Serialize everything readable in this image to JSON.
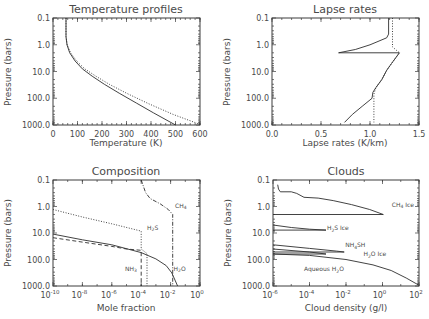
{
  "chart_data": [
    {
      "id": "temperature",
      "type": "line",
      "title": "Temperature profiles",
      "xlabel": "Temperature (K)",
      "ylabel": "Pressure (bars)",
      "xscale": "linear",
      "yscale": "log",
      "xlim": [
        0,
        600
      ],
      "ylim": [
        0.1,
        1000
      ],
      "y_inverted": true,
      "xticks": [
        0,
        100,
        200,
        300,
        400,
        500,
        600
      ],
      "xtick_labels": [
        "0",
        "100",
        "200",
        "300",
        "400",
        "500",
        "600"
      ],
      "yticks": [
        0.1,
        1,
        10,
        100,
        1000
      ],
      "ytick_labels": [
        "0.1",
        "1.0",
        "10.0",
        "100.0",
        "1000.0"
      ],
      "series": [
        {
          "name": "solid",
          "style": "solid",
          "points": [
            [
              53,
              0.1
            ],
            [
              53,
              0.5
            ],
            [
              57,
              1.0
            ],
            [
              68,
              2
            ],
            [
              90,
              4
            ],
            [
              120,
              8
            ],
            [
              160,
              15
            ],
            [
              210,
              30
            ],
            [
              270,
              65
            ],
            [
              340,
              150
            ],
            [
              410,
              350
            ],
            [
              500,
              1000
            ]
          ]
        },
        {
          "name": "dotted",
          "style": "dotted",
          "points": [
            [
              53,
              0.1
            ],
            [
              53,
              0.5
            ],
            [
              58,
              1.0
            ],
            [
              72,
              2
            ],
            [
              96,
              4
            ],
            [
              130,
              8
            ],
            [
              175,
              15
            ],
            [
              230,
              30
            ],
            [
              300,
              65
            ],
            [
              390,
              160
            ],
            [
              490,
              400
            ],
            [
              600,
              950
            ]
          ]
        }
      ]
    },
    {
      "id": "lapse",
      "type": "line",
      "title": "Lapse rates",
      "xlabel": "Lapse rates (K/km)",
      "ylabel": "Pressure (bars)",
      "xscale": "linear",
      "yscale": "log",
      "xlim": [
        0,
        1.5
      ],
      "ylim": [
        0.1,
        1000
      ],
      "y_inverted": true,
      "xticks": [
        0,
        0.5,
        1.0,
        1.5
      ],
      "xtick_labels": [
        "0.0",
        "0.5",
        "1.0",
        "1.5"
      ],
      "yticks": [
        0.1,
        1,
        10,
        100,
        1000
      ],
      "ytick_labels": [
        "0.1",
        "1.0",
        "10.0",
        "100.0",
        "1000.0"
      ],
      "series": [
        {
          "name": "solid",
          "style": "solid",
          "points": [
            [
              1.19,
              0.1
            ],
            [
              1.19,
              0.4
            ],
            [
              1.17,
              0.55
            ],
            [
              1.0,
              1.0
            ],
            [
              0.85,
              1.5
            ],
            [
              0.68,
              2.0
            ],
            [
              1.3,
              2.0
            ],
            [
              1.22,
              5
            ],
            [
              1.17,
              9
            ],
            [
              1.12,
              20
            ],
            [
              1.06,
              40
            ],
            [
              1.03,
              60
            ],
            [
              1.02,
              100
            ],
            [
              0.92,
              200
            ],
            [
              0.82,
              400
            ],
            [
              0.74,
              800
            ]
          ]
        },
        {
          "name": "dotted",
          "style": "dotted",
          "points": [
            [
              1.23,
              0.1
            ],
            [
              1.23,
              1.2
            ],
            [
              1.3,
              2.0
            ],
            [
              1.22,
              5
            ],
            [
              1.17,
              9
            ],
            [
              1.12,
              20
            ],
            [
              1.06,
              40
            ],
            [
              1.04,
              70
            ],
            [
              1.04,
              800
            ]
          ]
        }
      ]
    },
    {
      "id": "composition",
      "type": "line",
      "title": "Composition",
      "xlabel": "Mole fraction",
      "ylabel": "Pressure (bars)",
      "xscale": "log",
      "yscale": "log",
      "xlim": [
        1e-10,
        1
      ],
      "ylim": [
        0.1,
        1000
      ],
      "y_inverted": true,
      "xticks": [
        1e-10,
        1e-08,
        1e-06,
        0.0001,
        0.01,
        1
      ],
      "xtick_labels": [
        "10",
        "10",
        "10",
        "10",
        "10",
        "10"
      ],
      "xtick_exponents": [
        "-10",
        "-8",
        "-6",
        "-4",
        "-2",
        "0"
      ],
      "yticks": [
        0.1,
        1,
        10,
        100,
        1000
      ],
      "ytick_labels": [
        "0.1",
        "1.0",
        "10.0",
        "100.0",
        "1000.0"
      ],
      "series": [
        {
          "name": "CH4",
          "style": "dashdot",
          "points": [
            [
              0.0001,
              0.1
            ],
            [
              0.0002,
              0.3
            ],
            [
              0.0004,
              0.5
            ],
            [
              0.002,
              0.8
            ],
            [
              0.007,
              1.3
            ],
            [
              0.014,
              2.0
            ],
            [
              0.014,
              1000
            ]
          ]
        },
        {
          "name": "H2S",
          "style": "dotted",
          "points": [
            [
              1e-10,
              1.3
            ],
            [
              1e-08,
              2.5
            ],
            [
              1e-06,
              4.5
            ],
            [
              0.0001,
              8.5
            ],
            [
              0.0001,
              40
            ],
            [
              0.00025,
              60
            ],
            [
              0.00025,
              1000
            ]
          ]
        },
        {
          "name": "NH3",
          "style": "dashed",
          "points": [
            [
              1e-10,
              15
            ],
            [
              1e-08,
              22
            ],
            [
              1e-06,
              32
            ],
            [
              1e-05,
              40
            ],
            [
              0.0001,
              45
            ],
            [
              0.0001,
              1000
            ]
          ]
        },
        {
          "name": "H2O",
          "style": "solid",
          "points": [
            [
              1e-10,
              11
            ],
            [
              1e-08,
              18
            ],
            [
              1e-06,
              28
            ],
            [
              0.0001,
              55
            ],
            [
              0.001,
              95
            ],
            [
              0.005,
              170
            ],
            [
              0.012,
              320
            ],
            [
              0.02,
              600
            ],
            [
              0.03,
              1000
            ]
          ]
        }
      ],
      "annotations": [
        {
          "text": "CH",
          "sub": "4",
          "x": 0.02,
          "y": 1.1
        },
        {
          "text": "H",
          "sub": "2",
          "post": "S",
          "x": 0.00025,
          "y": 7.5
        },
        {
          "text": "NH",
          "sub": "3",
          "x": 8e-06,
          "y": 270
        },
        {
          "text": "H",
          "sub": "2",
          "post": "O",
          "x": 0.016,
          "y": 270
        }
      ]
    },
    {
      "id": "clouds",
      "type": "line",
      "title": "Clouds",
      "xlabel": "Cloud density (g/l)",
      "ylabel": "Pressure (bars)",
      "xscale": "log",
      "yscale": "log",
      "xlim": [
        1e-06,
        100
      ],
      "ylim": [
        0.1,
        1000
      ],
      "y_inverted": true,
      "xticks": [
        1e-06,
        0.0001,
        0.01,
        1,
        100
      ],
      "xtick_labels": [
        "10",
        "10",
        "10",
        "10",
        "10"
      ],
      "xtick_exponents": [
        "-6",
        "-4",
        "-2",
        "0",
        "2"
      ],
      "yticks": [
        0.1,
        1,
        10,
        100,
        1000
      ],
      "ytick_labels": [
        "0.1",
        "1.0",
        "10.0",
        "100.0",
        "1000.0"
      ],
      "series": [
        {
          "name": "CH4 Ice",
          "style": "solid",
          "points": [
            [
              1.8e-06,
              0.15
            ],
            [
              2e-06,
              0.22
            ],
            [
              2.5e-06,
              0.28
            ],
            [
              1e-05,
              0.28
            ],
            [
              2e-05,
              0.32
            ],
            [
              5e-05,
              0.45
            ],
            [
              0.0003,
              0.48
            ],
            [
              0.002,
              0.6
            ],
            [
              0.02,
              0.85
            ],
            [
              0.2,
              1.3
            ],
            [
              1.1,
              2.0
            ],
            [
              1e-06,
              2.0
            ]
          ]
        },
        {
          "name": "H2S Ice",
          "style": "solid",
          "points": [
            [
              1e-06,
              5
            ],
            [
              1e-05,
              6.2
            ],
            [
              0.0001,
              7.2
            ],
            [
              0.0008,
              7.8
            ],
            [
              1e-06,
              7.8
            ]
          ]
        },
        {
          "name": "NH4SH",
          "style": "solid",
          "points": [
            [
              1e-06,
              28
            ],
            [
              0.0001,
              38
            ],
            [
              0.003,
              48
            ],
            [
              0.008,
              52
            ],
            [
              1e-06,
              52
            ]
          ]
        },
        {
          "name": "H2O Ice",
          "style": "solid",
          "points": [
            [
              1e-06,
              40
            ],
            [
              0.0001,
              52
            ],
            [
              0.0008,
              62
            ],
            [
              1e-06,
              62
            ]
          ]
        },
        {
          "name": "Aqueous H2O",
          "style": "solid",
          "points": [
            [
              1e-06,
              62
            ],
            [
              0.0001,
              70
            ],
            [
              0.01,
              100
            ],
            [
              0.3,
              160
            ],
            [
              3,
              260
            ],
            [
              20,
              500
            ],
            [
              90,
              900
            ]
          ]
        }
      ],
      "annotations": [
        {
          "text": "CH",
          "sub": "4",
          "post": " Ice",
          "x": 3.2,
          "y": 1.0
        },
        {
          "text": "H",
          "sub": "2",
          "post": "S Ice",
          "x": 0.0009,
          "y": 8.0
        },
        {
          "text": "NH",
          "sub": "4",
          "post": "SH",
          "x": 0.009,
          "y": 35
        },
        {
          "text": "H",
          "sub": "2",
          "post": "O Ice",
          "x": 0.09,
          "y": 75
        },
        {
          "text": "Aqueous H",
          "sub": "2",
          "post": "O",
          "x": 5e-05,
          "y": 280
        }
      ]
    }
  ],
  "figure": {
    "panels": [
      {
        "title": "Temperature profiles",
        "xlabel": "Temperature (K)",
        "ylabel": "Pressure (bars)"
      },
      {
        "title": "Lapse rates",
        "xlabel": "Lapse rates (K/km)",
        "ylabel": "Pressure (bars)"
      },
      {
        "title": "Composition",
        "xlabel": "Mole fraction",
        "ylabel": "Pressure (bars)"
      },
      {
        "title": "Clouds",
        "xlabel": "Cloud density (g/l)",
        "ylabel": "Pressure (bars)"
      }
    ]
  }
}
